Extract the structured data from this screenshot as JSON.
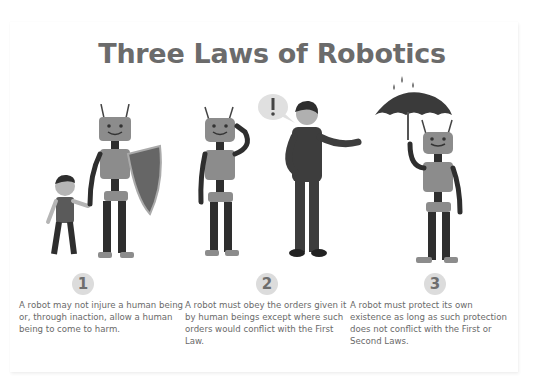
{
  "title": "Three Laws of Robotics",
  "laws": [
    {
      "number": "1",
      "text": "A robot may not injure a human being or, through inaction, allow a human being to come to harm.",
      "illustration": "robot-protecting-child-with-shield"
    },
    {
      "number": "2",
      "text": "A robot must obey the orders given it by human beings except where such orders would conflict with the First Law.",
      "illustration": "robot-receiving-order-from-man"
    },
    {
      "number": "3",
      "text": "A robot must protect its own existence as long as such protection does not conflict with the First or Second Laws.",
      "illustration": "robot-holding-umbrella-in-rain"
    }
  ],
  "colors": {
    "title": "#6b6b6b",
    "text": "#6a6a6a",
    "badge_bg": "#dcdcdc",
    "robot_body": "#8c8c8c",
    "robot_limbs": "#2e2e2e",
    "human_clothes": "#3d3d3d"
  }
}
